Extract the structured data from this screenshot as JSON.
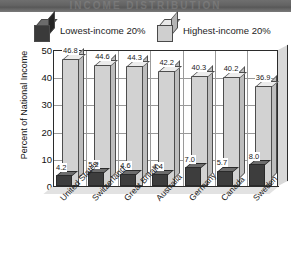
{
  "banner": {
    "ghost_text": "INCOME DISTRIBUTION"
  },
  "legend": [
    {
      "label": "Lowest-income 20%",
      "swatch": "dark-cube-icon",
      "color": "#3a3a3a"
    },
    {
      "label": "Highest-income 20%",
      "swatch": "light-cube-icon",
      "color": "#cfcfcf"
    }
  ],
  "chart_data": {
    "type": "bar",
    "title": "",
    "xlabel": "",
    "ylabel": "Percent of National Income",
    "ylim": [
      0,
      50
    ],
    "yticks": [
      0,
      10,
      20,
      30,
      40,
      50
    ],
    "ytick_labels": [
      "0",
      "10",
      "20",
      "30",
      "40",
      "50"
    ],
    "grid": true,
    "legend_position": "top",
    "categories": [
      "United States",
      "Switzerland",
      "Great Britain",
      "Australia",
      "Germany",
      "Canada",
      "Sweden"
    ],
    "series": [
      {
        "name": "Lowest-income 20%",
        "color": "#3a3a3a",
        "values": [
          4.2,
          5.2,
          4.6,
          4.4,
          7.0,
          5.7,
          8.0
        ],
        "value_labels": [
          "4.2",
          "5.2",
          "4.6",
          "4.4",
          "7.0",
          "5.7",
          "8.0"
        ]
      },
      {
        "name": "Highest-income 20%",
        "color": "#d2d2d2",
        "values": [
          46.8,
          44.6,
          44.3,
          42.2,
          40.3,
          40.2,
          36.9
        ],
        "value_labels": [
          "46.8",
          "44.6",
          "44.3",
          "42.2",
          "40.3",
          "40.2",
          "36.9"
        ]
      }
    ]
  }
}
